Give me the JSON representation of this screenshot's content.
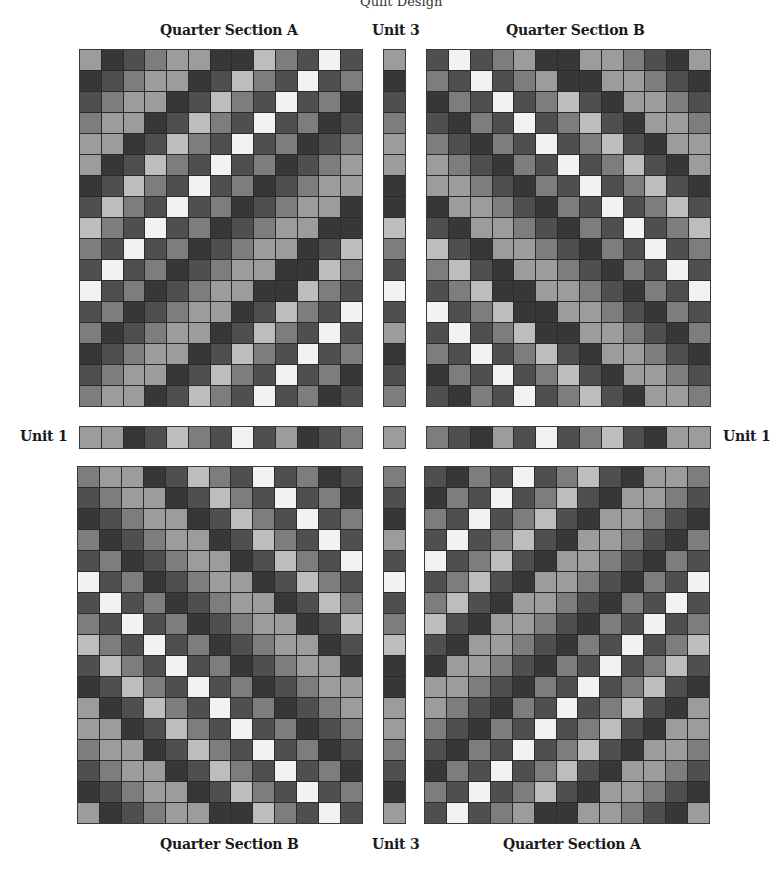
{
  "labels": {
    "top_cut": "Quilt Design",
    "top_left": "Quarter Section A",
    "top_center": "Unit 3",
    "top_right": "Quarter Section B",
    "mid_left": "Unit 1",
    "mid_right": "Unit 1",
    "bottom_left": "Quarter Section B",
    "bottom_center": "Unit 3",
    "bottom_right": "Quarter Section A"
  },
  "palette": [
    "#f2f2f2",
    "#bdbdbd",
    "#9c9c9c",
    "#7d7d7d",
    "#4f4f4f",
    "#373737"
  ],
  "grids": {
    "top_left": [
      [
        2,
        5,
        4,
        3,
        2,
        2,
        5,
        5,
        1,
        3,
        4,
        0,
        4
      ],
      [
        5,
        4,
        3,
        2,
        2,
        5,
        4,
        1,
        3,
        4,
        0,
        4,
        3
      ],
      [
        4,
        3,
        2,
        2,
        5,
        4,
        1,
        3,
        4,
        0,
        4,
        3,
        5
      ],
      [
        3,
        2,
        2,
        5,
        4,
        1,
        3,
        4,
        0,
        4,
        3,
        5,
        4
      ],
      [
        2,
        2,
        5,
        4,
        1,
        3,
        4,
        0,
        4,
        3,
        5,
        4,
        3
      ],
      [
        2,
        5,
        4,
        1,
        3,
        4,
        0,
        4,
        3,
        5,
        4,
        3,
        2
      ],
      [
        5,
        4,
        1,
        3,
        4,
        0,
        4,
        3,
        5,
        4,
        3,
        2,
        2
      ],
      [
        4,
        1,
        3,
        4,
        0,
        4,
        3,
        5,
        4,
        3,
        2,
        2,
        5
      ],
      [
        1,
        3,
        4,
        0,
        4,
        3,
        5,
        4,
        3,
        2,
        2,
        5,
        5
      ],
      [
        3,
        4,
        0,
        4,
        3,
        5,
        4,
        3,
        2,
        2,
        5,
        4,
        1
      ],
      [
        4,
        0,
        4,
        3,
        5,
        4,
        3,
        2,
        2,
        5,
        5,
        1,
        3
      ],
      [
        0,
        4,
        3,
        5,
        4,
        3,
        2,
        2,
        5,
        5,
        1,
        3,
        4
      ],
      [
        4,
        3,
        5,
        4,
        3,
        2,
        2,
        5,
        4,
        1,
        3,
        4,
        0
      ],
      [
        3,
        5,
        4,
        3,
        2,
        2,
        5,
        4,
        1,
        3,
        4,
        0,
        4
      ],
      [
        5,
        4,
        3,
        2,
        2,
        5,
        4,
        1,
        3,
        4,
        0,
        4,
        3
      ],
      [
        4,
        3,
        2,
        2,
        5,
        4,
        1,
        3,
        4,
        0,
        4,
        3,
        5
      ],
      [
        3,
        2,
        2,
        5,
        4,
        1,
        3,
        4,
        0,
        4,
        3,
        5,
        4
      ]
    ],
    "top_right": [
      [
        4,
        0,
        4,
        3,
        2,
        5,
        5,
        2,
        2,
        3,
        4,
        5,
        2
      ],
      [
        3,
        4,
        0,
        4,
        3,
        2,
        5,
        5,
        2,
        2,
        3,
        4,
        5
      ],
      [
        5,
        3,
        4,
        0,
        4,
        3,
        1,
        4,
        5,
        2,
        2,
        3,
        4
      ],
      [
        4,
        5,
        3,
        4,
        0,
        4,
        3,
        1,
        4,
        5,
        2,
        2,
        3
      ],
      [
        3,
        4,
        5,
        3,
        4,
        0,
        4,
        3,
        1,
        4,
        5,
        2,
        2
      ],
      [
        2,
        3,
        4,
        5,
        3,
        4,
        0,
        4,
        3,
        1,
        4,
        5,
        2
      ],
      [
        2,
        2,
        3,
        4,
        5,
        3,
        4,
        0,
        4,
        3,
        1,
        4,
        5
      ],
      [
        5,
        2,
        2,
        3,
        4,
        5,
        3,
        4,
        0,
        4,
        3,
        1,
        4
      ],
      [
        4,
        5,
        2,
        2,
        3,
        4,
        5,
        3,
        4,
        0,
        4,
        3,
        1
      ],
      [
        1,
        4,
        5,
        2,
        2,
        3,
        4,
        5,
        3,
        4,
        0,
        4,
        3
      ],
      [
        3,
        1,
        4,
        5,
        2,
        2,
        3,
        4,
        5,
        3,
        4,
        0,
        4
      ],
      [
        4,
        3,
        1,
        5,
        5,
        2,
        2,
        3,
        4,
        5,
        3,
        4,
        0
      ],
      [
        0,
        4,
        3,
        1,
        5,
        5,
        2,
        2,
        3,
        4,
        5,
        3,
        4
      ],
      [
        4,
        0,
        4,
        3,
        1,
        5,
        5,
        2,
        2,
        3,
        4,
        5,
        3
      ],
      [
        3,
        4,
        0,
        4,
        3,
        1,
        4,
        5,
        2,
        2,
        3,
        4,
        5
      ],
      [
        5,
        3,
        4,
        0,
        4,
        3,
        1,
        4,
        5,
        2,
        2,
        3,
        4
      ],
      [
        4,
        5,
        3,
        4,
        0,
        4,
        3,
        1,
        4,
        5,
        2,
        2,
        3
      ]
    ],
    "bottom_left": [
      [
        3,
        2,
        2,
        5,
        4,
        1,
        3,
        4,
        0,
        4,
        3,
        5,
        4
      ],
      [
        4,
        3,
        2,
        2,
        5,
        4,
        1,
        3,
        4,
        0,
        4,
        3,
        5
      ],
      [
        5,
        4,
        3,
        2,
        2,
        5,
        4,
        1,
        3,
        4,
        0,
        4,
        3
      ],
      [
        3,
        5,
        4,
        3,
        2,
        2,
        5,
        4,
        1,
        3,
        4,
        0,
        4
      ],
      [
        4,
        3,
        5,
        4,
        3,
        2,
        2,
        5,
        4,
        1,
        3,
        4,
        0
      ],
      [
        0,
        4,
        3,
        5,
        4,
        3,
        2,
        2,
        5,
        4,
        1,
        3,
        4
      ],
      [
        4,
        0,
        4,
        3,
        5,
        4,
        3,
        2,
        2,
        5,
        4,
        1,
        3
      ],
      [
        3,
        4,
        0,
        4,
        3,
        5,
        4,
        3,
        2,
        2,
        5,
        4,
        1
      ],
      [
        1,
        3,
        4,
        0,
        4,
        3,
        5,
        4,
        3,
        2,
        2,
        5,
        4
      ],
      [
        4,
        1,
        3,
        4,
        0,
        4,
        3,
        5,
        4,
        3,
        2,
        2,
        5
      ],
      [
        5,
        4,
        1,
        3,
        4,
        0,
        4,
        3,
        5,
        4,
        3,
        2,
        2
      ],
      [
        2,
        5,
        4,
        1,
        3,
        4,
        0,
        4,
        3,
        5,
        4,
        3,
        2
      ],
      [
        2,
        2,
        5,
        4,
        1,
        3,
        4,
        0,
        4,
        3,
        5,
        4,
        3
      ],
      [
        3,
        2,
        2,
        5,
        4,
        1,
        3,
        4,
        0,
        4,
        3,
        5,
        4
      ],
      [
        4,
        3,
        2,
        2,
        5,
        4,
        1,
        3,
        4,
        0,
        4,
        3,
        5
      ],
      [
        5,
        4,
        3,
        2,
        2,
        5,
        4,
        1,
        3,
        4,
        0,
        4,
        3
      ],
      [
        2,
        5,
        4,
        3,
        2,
        2,
        5,
        5,
        1,
        3,
        4,
        0,
        4
      ]
    ],
    "bottom_right": [
      [
        4,
        5,
        3,
        4,
        0,
        4,
        3,
        1,
        4,
        5,
        2,
        2,
        3
      ],
      [
        5,
        3,
        4,
        0,
        4,
        3,
        1,
        4,
        5,
        2,
        2,
        3,
        4
      ],
      [
        3,
        4,
        0,
        4,
        3,
        1,
        4,
        5,
        2,
        2,
        3,
        4,
        5
      ],
      [
        4,
        0,
        4,
        3,
        1,
        4,
        5,
        2,
        2,
        3,
        4,
        5,
        3
      ],
      [
        0,
        4,
        3,
        1,
        4,
        5,
        2,
        2,
        3,
        4,
        5,
        3,
        4
      ],
      [
        4,
        3,
        1,
        4,
        5,
        2,
        2,
        3,
        4,
        5,
        3,
        4,
        0
      ],
      [
        3,
        1,
        4,
        5,
        2,
        2,
        3,
        4,
        5,
        3,
        4,
        0,
        4
      ],
      [
        1,
        4,
        5,
        2,
        2,
        3,
        4,
        5,
        3,
        4,
        0,
        4,
        3
      ],
      [
        4,
        5,
        2,
        2,
        3,
        4,
        5,
        3,
        4,
        0,
        4,
        3,
        1
      ],
      [
        5,
        2,
        2,
        3,
        4,
        5,
        3,
        4,
        0,
        4,
        3,
        1,
        4
      ],
      [
        2,
        2,
        3,
        4,
        5,
        3,
        4,
        0,
        4,
        3,
        1,
        4,
        5
      ],
      [
        2,
        3,
        4,
        5,
        3,
        4,
        0,
        4,
        3,
        1,
        4,
        5,
        2
      ],
      [
        3,
        4,
        5,
        3,
        4,
        0,
        4,
        3,
        1,
        4,
        5,
        2,
        2
      ],
      [
        4,
        5,
        3,
        4,
        0,
        4,
        3,
        1,
        4,
        5,
        2,
        2,
        3
      ],
      [
        5,
        3,
        4,
        0,
        4,
        3,
        1,
        4,
        5,
        2,
        2,
        3,
        4
      ],
      [
        3,
        4,
        0,
        4,
        3,
        1,
        4,
        5,
        2,
        2,
        3,
        4,
        5
      ],
      [
        4,
        0,
        4,
        3,
        2,
        5,
        5,
        2,
        2,
        3,
        4,
        5,
        2
      ]
    ],
    "unit1_left": [
      [
        2,
        2,
        5,
        4,
        1,
        3,
        4,
        0,
        4,
        2,
        5,
        4,
        3
      ]
    ],
    "unit1_right": [
      [
        3,
        4,
        5,
        2,
        4,
        0,
        4,
        3,
        1,
        4,
        5,
        2,
        2
      ]
    ],
    "unit1_center": [
      [
        2
      ]
    ],
    "unit3_top": [
      [
        2
      ],
      [
        5
      ],
      [
        4
      ],
      [
        3
      ],
      [
        2
      ],
      [
        2
      ],
      [
        5
      ],
      [
        5
      ],
      [
        1
      ],
      [
        3
      ],
      [
        4
      ],
      [
        0
      ],
      [
        4
      ],
      [
        2
      ],
      [
        5
      ],
      [
        4
      ],
      [
        3
      ]
    ],
    "unit3_bottom": [
      [
        3
      ],
      [
        4
      ],
      [
        5
      ],
      [
        2
      ],
      [
        4
      ],
      [
        0
      ],
      [
        4
      ],
      [
        3
      ],
      [
        1
      ],
      [
        5
      ],
      [
        5
      ],
      [
        2
      ],
      [
        2
      ],
      [
        3
      ],
      [
        4
      ],
      [
        5
      ],
      [
        2
      ]
    ]
  }
}
